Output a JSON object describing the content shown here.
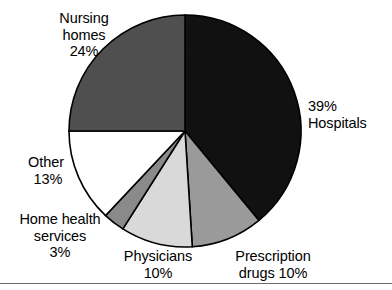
{
  "chart_data": {
    "type": "pie",
    "title": "",
    "subtitle": "",
    "xlabel": "",
    "ylabel": "",
    "legend_position": "none",
    "grid": false,
    "units": "percent",
    "start_angle_deg": 0,
    "direction": "clockwise",
    "categories": [
      "Hospitals",
      "Prescription drugs",
      "Physicians",
      "Home health services",
      "Other",
      "Nursing homes"
    ],
    "values": [
      39,
      10,
      10,
      3,
      13,
      24
    ],
    "colors": [
      "#111111",
      "#9a9a9a",
      "#d9d9d9",
      "#8a8a8a",
      "#ffffff",
      "#4f4f4f"
    ],
    "slices": [
      {
        "name": "Hospitals",
        "value": 39,
        "percent_text": "39%",
        "label_line1": "39%",
        "label_line2": "Hospitals",
        "color": "#111111",
        "start_deg": 0,
        "end_deg": 140.4
      },
      {
        "name": "Prescription drugs",
        "value": 10,
        "percent_text": "10%",
        "label_line1": "Prescription",
        "label_line2": "drugs 10%",
        "color": "#9a9a9a",
        "start_deg": 140.4,
        "end_deg": 176.4
      },
      {
        "name": "Physicians",
        "value": 10,
        "percent_text": "10%",
        "label_line1": "Physicians",
        "label_line2": "10%",
        "color": "#d9d9d9",
        "start_deg": 176.4,
        "end_deg": 212.4
      },
      {
        "name": "Home health services",
        "value": 3,
        "percent_text": "3%",
        "label_line1": "Home health",
        "label_line2": "services",
        "label_line3": "3%",
        "color": "#8a8a8a",
        "start_deg": 212.4,
        "end_deg": 223.2
      },
      {
        "name": "Other",
        "value": 13,
        "percent_text": "13%",
        "label_line1": "Other",
        "label_line2": "13%",
        "color": "#ffffff",
        "start_deg": 223.2,
        "end_deg": 270.0
      },
      {
        "name": "Nursing homes",
        "value": 24,
        "percent_text": "24%",
        "label_line1": "Nursing",
        "label_line2": "homes",
        "label_line3": "24%",
        "color": "#4f4f4f",
        "start_deg": 270.0,
        "end_deg": 360.0
      }
    ],
    "geometry": {
      "center_x": 185,
      "center_y": 131,
      "radius": 116
    }
  },
  "labels": {
    "nursing_homes": "Nursing\nhomes\n24%",
    "hospitals": "39%\nHospitals",
    "other": "Other\n 13%",
    "home_health_services": "Home health\nservices\n3%",
    "physicians": "Physicians\n10%",
    "prescription_drugs": "Prescription\ndrugs 10%"
  }
}
